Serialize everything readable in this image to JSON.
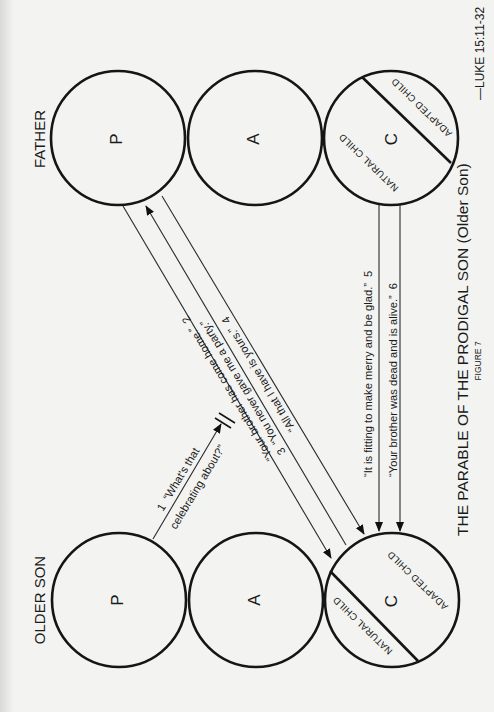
{
  "diagram": {
    "title": "THE PARABLE OF THE PRODIGAL SON (Older Son)",
    "figure_label": "FIGURE 7",
    "reference": "—LUKE 15:11-32",
    "columns": {
      "father": {
        "label": "FATHER",
        "states": [
          {
            "letter": "P"
          },
          {
            "letter": "A"
          },
          {
            "letter": "C",
            "sub_top": "ADAPTED CHILD",
            "sub_bottom": "NATURAL CHILD"
          }
        ]
      },
      "older_son": {
        "label": "OLDER SON",
        "states": [
          {
            "letter": "P"
          },
          {
            "letter": "A"
          },
          {
            "letter": "C",
            "sub_top": "ADAPTED CHILD",
            "sub_bottom": "NATURAL CHILD"
          }
        ]
      }
    },
    "messages": [
      {
        "number": "1",
        "line1": "“What's that",
        "line2": "celebrating about?”",
        "from": "Older Son P",
        "to": "crossed (blocked)"
      },
      {
        "number": "2",
        "text": "“Your brother has come home.”",
        "from": "Father P",
        "to": "Older Son C"
      },
      {
        "number": "3",
        "text": "“You never gave me a party.”",
        "from": "Older Son C",
        "to": "Father P"
      },
      {
        "number": "4",
        "text": "“All that I have is yours.”",
        "from": "Father P",
        "to": "Older Son C"
      },
      {
        "number": "5",
        "text": "“It is fitting to make merry and be glad.”",
        "from": "Father C",
        "to": "Older Son C"
      },
      {
        "number": "6",
        "text": "“Your brother was dead and is alive.”",
        "from": "Father C",
        "to": "Older Son C"
      }
    ]
  },
  "colors": {
    "background": "#f3f3f1",
    "ink": "#151515"
  }
}
